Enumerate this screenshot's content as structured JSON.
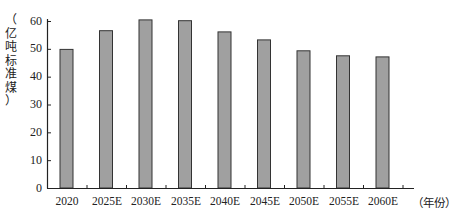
{
  "chart_data": {
    "type": "bar",
    "title": "",
    "xlabel": "（年份）",
    "ylabel": "（亿吨标准煤）",
    "ylim": [
      0,
      60
    ],
    "yticks": [
      0,
      10,
      20,
      30,
      40,
      50,
      60
    ],
    "categories": [
      "2020",
      "2025E",
      "2030E",
      "2035E",
      "2040E",
      "2045E",
      "2050E",
      "2055E",
      "2060E"
    ],
    "values": [
      49.8,
      56.5,
      60.4,
      60.1,
      56.1,
      53.2,
      49.3,
      47.5,
      47.1
    ],
    "bar_color": "#a0a0a0",
    "bar_edge_color": "#333333",
    "grid": false,
    "legend": null
  },
  "labels": {
    "ylabel_chars": [
      "（",
      "亿",
      "吨",
      "标",
      "准",
      "煤",
      "）"
    ],
    "yticks": [
      "60",
      "50",
      "40",
      "30",
      "20",
      "10",
      "0"
    ],
    "xticks": [
      "2020",
      "2025E",
      "2030E",
      "2035E",
      "2040E",
      "2045E",
      "2050E",
      "2055E",
      "2060E"
    ],
    "xunit": "（年份）"
  }
}
